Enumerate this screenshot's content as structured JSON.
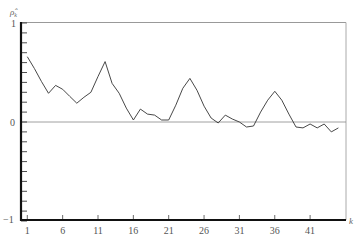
{
  "chart_data": {
    "type": "line",
    "title": "",
    "xlabel": "k",
    "ylabel": "ρ̂_k",
    "xlim": [
      1,
      48
    ],
    "ylim": [
      -1,
      1
    ],
    "x_ticks": [
      1,
      6,
      11,
      16,
      21,
      26,
      31,
      36,
      41
    ],
    "y_ticks": [
      {
        "value": 1,
        "label": "1"
      },
      {
        "value": 0,
        "label": "0"
      },
      {
        "value": -1,
        "label": "-1"
      }
    ],
    "y_minor_tick_step": 0.1,
    "zero_line": true,
    "grid": false,
    "legend": null,
    "x": [
      1,
      2,
      3,
      4,
      5,
      6,
      7,
      8,
      9,
      10,
      11,
      12,
      13,
      14,
      15,
      16,
      17,
      18,
      19,
      20,
      21,
      22,
      23,
      24,
      25,
      26,
      27,
      28,
      29,
      30,
      31,
      32,
      33,
      34,
      35,
      36,
      37,
      38,
      39,
      40,
      41,
      42,
      43,
      44,
      45
    ],
    "values": [
      0.66,
      0.54,
      0.41,
      0.29,
      0.37,
      0.33,
      0.26,
      0.19,
      0.25,
      0.3,
      0.46,
      0.61,
      0.39,
      0.29,
      0.14,
      0.02,
      0.13,
      0.08,
      0.07,
      0.02,
      0.02,
      0.17,
      0.34,
      0.44,
      0.32,
      0.16,
      0.04,
      -0.01,
      0.07,
      0.03,
      0.0,
      -0.05,
      -0.04,
      0.1,
      0.22,
      0.31,
      0.22,
      0.08,
      -0.05,
      -0.06,
      -0.02,
      -0.06,
      -0.02,
      -0.1,
      -0.06
    ],
    "colors": {
      "line": "#333333",
      "axis": "#111111",
      "frame": "#999999",
      "zero_line": "#888888"
    }
  },
  "labels": {
    "y_axis_symbol": "ρ̂",
    "y_axis_subscript": "k",
    "x_axis_symbol": "k",
    "y_top": "1",
    "y_zero": "0",
    "y_bottom": "−1"
  }
}
